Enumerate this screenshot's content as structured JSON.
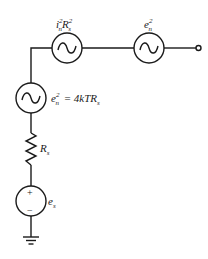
{
  "diagram": {
    "type": "circuit",
    "stroke_color": "#1a1a1a",
    "background": "#ffffff",
    "components": [
      {
        "id": "current-noise-source",
        "kind": "ac-source",
        "label_base": "i",
        "label_sup": "2",
        "label_sub": "n",
        "label_base2": "R",
        "label_sup2": "2",
        "label_sub2": "s"
      },
      {
        "id": "voltage-noise-source",
        "kind": "ac-source",
        "label_base": "e",
        "label_sup": "2",
        "label_sub": "n"
      },
      {
        "id": "thermal-noise-source",
        "kind": "ac-source",
        "label_base": "e",
        "label_sup": "2",
        "label_sub": "n",
        "equation": "= 4kTR",
        "equation_sub": "s"
      },
      {
        "id": "source-resistor",
        "kind": "resistor",
        "label_base": "R",
        "label_sub": "s"
      },
      {
        "id": "signal-source",
        "kind": "dc-source",
        "label_base": "e",
        "label_sub": "s",
        "plus": "+",
        "minus": "−"
      },
      {
        "id": "ground",
        "kind": "ground"
      },
      {
        "id": "output-terminal",
        "kind": "terminal"
      }
    ]
  }
}
